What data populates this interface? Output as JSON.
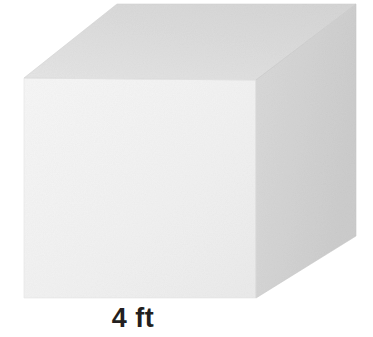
{
  "figure": {
    "kind": "cube-diagram",
    "background_color": "#FFFFFF",
    "label": {
      "text": "4 ft",
      "value": "4",
      "unit": "ft",
      "color": "#231F20"
    },
    "shape": {
      "name": "cube",
      "edge_length": "4 ft",
      "faces": [
        {
          "name": "front-face",
          "fill_light": "#F4F4F4",
          "fill_dark": "#E9E9E9",
          "points": "24,78 256,80 256,298 24,298"
        },
        {
          "name": "top-face",
          "fill_light": "#E2E2E2",
          "fill_dark": "#D6D6D6",
          "points": "24,78 117,4 356,4 256,80"
        },
        {
          "name": "right-face",
          "fill_light": "#D8D8D8",
          "fill_dark": "#CBCBCB",
          "points": "256,80 356,4 356,236 256,298"
        }
      ]
    }
  }
}
